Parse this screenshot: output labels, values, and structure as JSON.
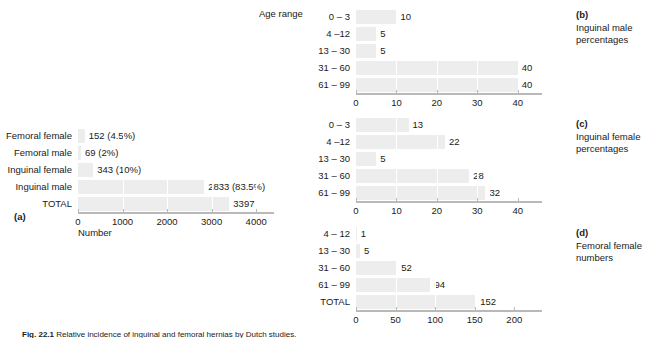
{
  "figure": {
    "caption_prefix": "Fig. 22.1",
    "caption_text": "Relative incidence of inguinal and femoral hernias by Dutch studies."
  },
  "header": {
    "age_range_label": "Age range"
  },
  "chart_data": [
    {
      "id": "a",
      "type": "bar",
      "orientation": "horizontal",
      "panel_letter": "(a)",
      "title": "",
      "xlabel": "Number",
      "ylabel": "",
      "categories": [
        "Femoral female",
        "Femoral male",
        "Inguinal female",
        "Inguinal male",
        "TOTAL"
      ],
      "values": [
        152,
        69,
        343,
        2833,
        3397
      ],
      "value_labels": [
        "152 (4.5%)",
        "69 (2%)",
        "343 (10%)",
        "2833 (83.5%)",
        "3397"
      ],
      "ticks": [
        0,
        1000,
        2000,
        3000,
        4000
      ],
      "tick_labels": [
        "0",
        "1000",
        "2000",
        "3000",
        "4000"
      ],
      "xlim": [
        0,
        4400
      ],
      "grid": true,
      "legend": ""
    },
    {
      "id": "b",
      "type": "bar",
      "orientation": "horizontal",
      "panel_letter": "(b)",
      "title": "Inguinal male\npercentages",
      "xlabel": "",
      "ylabel": "",
      "categories": [
        "0 – 3",
        "4 –12",
        "13 – 30",
        "31 – 60",
        "61 – 99"
      ],
      "values": [
        10,
        5,
        5,
        40,
        40
      ],
      "value_labels": [
        "10",
        "5",
        "5",
        "40",
        "40"
      ],
      "ticks": [
        0,
        10,
        20,
        30,
        40
      ],
      "tick_labels": [
        "0",
        "10",
        "20",
        "30",
        "40"
      ],
      "xlim": [
        0,
        46
      ],
      "grid": true
    },
    {
      "id": "c",
      "type": "bar",
      "orientation": "horizontal",
      "panel_letter": "(c)",
      "title": "Inguinal female\npercentages",
      "xlabel": "",
      "ylabel": "",
      "categories": [
        "0 – 3",
        "4 –12",
        "13 – 30",
        "31 – 60",
        "61 – 99"
      ],
      "values": [
        13,
        22,
        5,
        28,
        32
      ],
      "value_labels": [
        "13",
        "22",
        "5",
        "28",
        "32"
      ],
      "ticks": [
        0,
        10,
        20,
        30,
        40
      ],
      "tick_labels": [
        "0",
        "10",
        "20",
        "30",
        "40"
      ],
      "xlim": [
        0,
        46
      ],
      "grid": true
    },
    {
      "id": "d",
      "type": "bar",
      "orientation": "horizontal",
      "panel_letter": "(d)",
      "title": "Femoral female\nnumbers",
      "xlabel": "",
      "ylabel": "",
      "categories": [
        "4 – 12",
        "13 – 30",
        "31 – 60",
        "61 – 99",
        "TOTAL"
      ],
      "values": [
        1,
        5,
        52,
        94,
        152
      ],
      "value_labels": [
        "1",
        "5",
        "52",
        "94",
        "152"
      ],
      "ticks": [
        0,
        50,
        100,
        150,
        200
      ],
      "tick_labels": [
        "0",
        "50",
        "100",
        "150",
        "200"
      ],
      "xlim": [
        0,
        235
      ],
      "grid": true
    }
  ],
  "colors": {
    "bar": "#ededed",
    "axis": "#b9b9b9",
    "gridline": "#ffffff",
    "text": "#1a1a1a"
  }
}
